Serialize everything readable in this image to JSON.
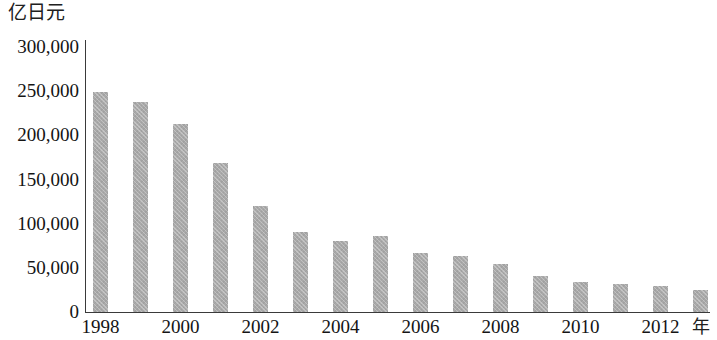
{
  "chart_data": {
    "type": "bar",
    "title": "",
    "subtitle": "",
    "ylabel": "亿日元",
    "xlabel": "年",
    "ylim": [
      0,
      300000
    ],
    "ytick_labels": [
      "300,000",
      "250,000",
      "200,000",
      "150,000",
      "100,000",
      "50,000",
      "0"
    ],
    "ytick_values": [
      300000,
      250000,
      200000,
      150000,
      100000,
      50000,
      0
    ],
    "grid": false,
    "legend": null,
    "bar_color": "#a9a9a9",
    "axis_color": "#3a3a3a",
    "categories": [
      1998,
      1999,
      2000,
      2001,
      2002,
      2003,
      2004,
      2005,
      2006,
      2007,
      2008,
      2009,
      2010,
      2011,
      2012,
      2013
    ],
    "xtick_labels_shown": [
      "1998",
      "2000",
      "2002",
      "2004",
      "2006",
      "2008",
      "2010",
      "2012"
    ],
    "values": [
      249000,
      238000,
      213000,
      169000,
      120000,
      91000,
      80000,
      86000,
      67000,
      63000,
      54000,
      41000,
      34000,
      32000,
      29000,
      25000
    ],
    "series": [
      {
        "name": "",
        "values": [
          249000,
          238000,
          213000,
          169000,
          120000,
          91000,
          80000,
          86000,
          67000,
          63000,
          54000,
          41000,
          34000,
          32000,
          29000,
          25000
        ]
      }
    ]
  }
}
